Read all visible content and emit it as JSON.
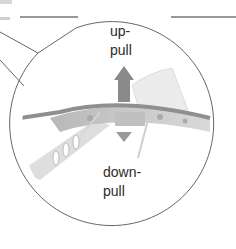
{
  "diagram": {
    "labels": {
      "up_line1": "up-",
      "up_line2": "pull",
      "down_line1": "down-",
      "down_line2": "pull"
    },
    "colors": {
      "outline": "#555555",
      "arrow": "#8a8a8a",
      "wing_surface": "#9a9a9a",
      "structure": "#c8c8c8",
      "background": "#ffffff"
    }
  }
}
